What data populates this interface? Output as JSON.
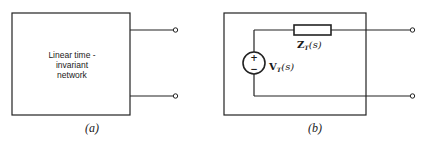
{
  "figure_a": {
    "caption": "(a)",
    "block_label_lines": [
      "Linear time -",
      "invariant",
      "network"
    ],
    "terminals": 2
  },
  "figure_b": {
    "caption": "(b)",
    "impedance": {
      "symbol": "Z",
      "subscript": "T",
      "arg": "(s)"
    },
    "source": {
      "symbol": "V",
      "subscript": "T",
      "arg": "(s)",
      "plus": "+",
      "minus": "−"
    },
    "terminals": 2
  }
}
